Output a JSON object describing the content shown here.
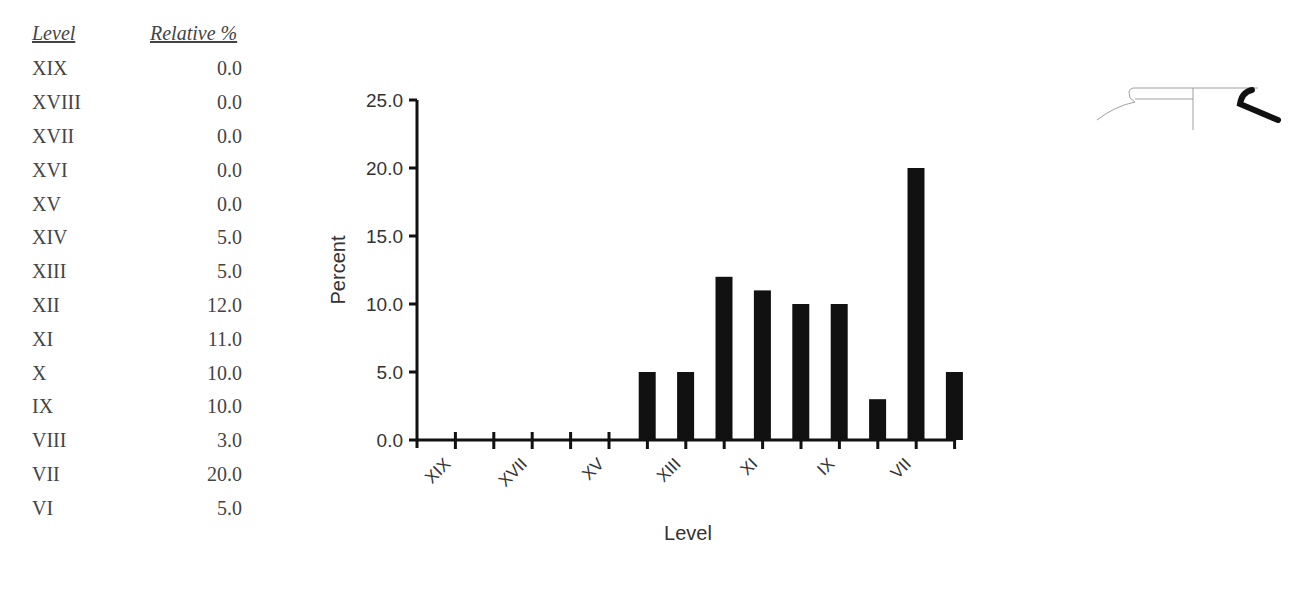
{
  "table": {
    "headers": {
      "level": "Level",
      "relative": "Relative %"
    },
    "rows": [
      {
        "level": "XIX",
        "value": "0.0"
      },
      {
        "level": "XVIII",
        "value": "0.0"
      },
      {
        "level": "XVII",
        "value": "0.0"
      },
      {
        "level": "XVI",
        "value": "0.0"
      },
      {
        "level": "XV",
        "value": "0.0"
      },
      {
        "level": "XIV",
        "value": "5.0"
      },
      {
        "level": "XIII",
        "value": "5.0"
      },
      {
        "level": "XII",
        "value": "12.0"
      },
      {
        "level": "XI",
        "value": "11.0"
      },
      {
        "level": "X",
        "value": "10.0"
      },
      {
        "level": "IX",
        "value": "10.0"
      },
      {
        "level": "VIII",
        "value": "3.0"
      },
      {
        "level": "VII",
        "value": "20.0"
      },
      {
        "level": "VI",
        "value": "5.0"
      }
    ]
  },
  "chart": {
    "ylabel": "Percent",
    "xlabel": "Level",
    "yticks": [
      "25.0",
      "20.0",
      "15.0",
      "10.0",
      "5.0",
      "0.0"
    ],
    "xticks_shown": [
      "XIX",
      "XVII",
      "XV",
      "XIII",
      "XI",
      "IX",
      "VII"
    ],
    "bar_color": "#111111"
  },
  "chart_data": {
    "type": "bar",
    "title": "",
    "categories": [
      "XIX",
      "XVIII",
      "XVII",
      "XVI",
      "XV",
      "XIV",
      "XIII",
      "XII",
      "XI",
      "X",
      "IX",
      "VIII",
      "VII",
      "VI"
    ],
    "values": [
      0.0,
      0.0,
      0.0,
      0.0,
      0.0,
      5.0,
      5.0,
      12.0,
      11.0,
      10.0,
      10.0,
      3.0,
      20.0,
      5.0
    ],
    "xlabel": "Level",
    "ylabel": "Percent",
    "ylim": [
      0,
      25
    ],
    "yticks": [
      0,
      5,
      10,
      15,
      20,
      25
    ],
    "grid": false,
    "legend": null
  }
}
